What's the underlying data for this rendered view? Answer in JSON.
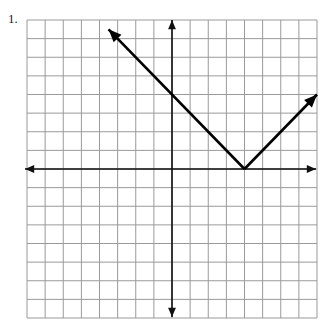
{
  "problem": {
    "number_label": "1."
  },
  "chart_data": {
    "type": "line",
    "title": "",
    "equation": "y = |x - 4|",
    "grid": true,
    "xlim": [
      -8,
      8
    ],
    "ylim": [
      -8,
      8
    ],
    "xlabel": "",
    "ylabel": "",
    "tick_labels": false,
    "series": [
      {
        "name": "y = |x - 4|",
        "points": [
          [
            -3.5,
            7.5
          ],
          [
            4,
            0
          ],
          [
            8,
            4
          ]
        ],
        "vertex": [
          4,
          0
        ],
        "arrows_at_ends": true
      }
    ],
    "colors": {
      "grid": "#9a9a9a",
      "axes": "#111111",
      "curve": "#000000"
    }
  }
}
